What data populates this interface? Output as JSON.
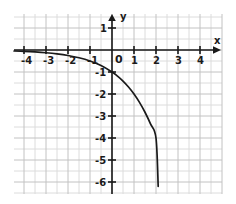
{
  "figure": {
    "title": "",
    "origin_label": "0",
    "x_axis_name": "x",
    "y_axis_name": "y"
  },
  "chart_data": {
    "type": "line",
    "title": "",
    "subtitle": "",
    "xlabel": "x",
    "ylabel": "y",
    "function": "y = -2^x",
    "xlim": [
      -4.45,
      5.0
    ],
    "ylim": [
      -6.65,
      1.65
    ],
    "grid": true,
    "minor_grid": true,
    "legend": null,
    "legend_position": "none",
    "x_ticks": [
      -4,
      -3,
      -2,
      -1,
      0,
      1,
      2,
      3,
      4
    ],
    "x_tick_labels": [
      "-4",
      "-3",
      "-2",
      "-1",
      "0",
      "1",
      "2",
      "3",
      "4"
    ],
    "x_tick_labels_shown": [
      "-4",
      "-3",
      "-2",
      "-1",
      "1",
      "2",
      "3",
      "4"
    ],
    "y_ticks": [
      1,
      -1,
      -2,
      -3,
      -4,
      -5,
      -6
    ],
    "y_tick_labels": [
      "1",
      "-1",
      "-2",
      "-3",
      "-4",
      "-5",
      "-6"
    ],
    "minor_step": 0.5,
    "series": [
      {
        "name": "y = -2^x",
        "color": "#1a1a1a",
        "x": [
          -4.45,
          -4.0,
          -3.5,
          -3.0,
          -2.5,
          -2.0,
          -1.5,
          -1.0,
          -0.5,
          0.0,
          0.25,
          0.5,
          0.75,
          1.0,
          1.25,
          1.5,
          1.75,
          2.0,
          2.1
        ],
        "y": [
          -0.046,
          -0.0625,
          -0.088,
          -0.125,
          -0.177,
          -0.25,
          -0.354,
          -0.5,
          -0.707,
          -1.0,
          -1.19,
          -1.414,
          -1.682,
          -2.0,
          -2.38,
          -2.83,
          -3.36,
          -4.0,
          -6.2
        ]
      }
    ],
    "key_points": [
      {
        "x": 0,
        "y": -1,
        "note": "y-intercept"
      },
      {
        "x": 1,
        "y": -2
      },
      {
        "x": 2,
        "y": -4
      }
    ],
    "asymptote": {
      "type": "horizontal",
      "y": 0
    }
  },
  "colors": {
    "background": "#ffffff",
    "grid_minor": "#dcdcdc",
    "grid_major": "#c2c2c2",
    "axis": "#1a1a1a",
    "curve": "#1a1a1a",
    "label": "#1a1a1a"
  }
}
